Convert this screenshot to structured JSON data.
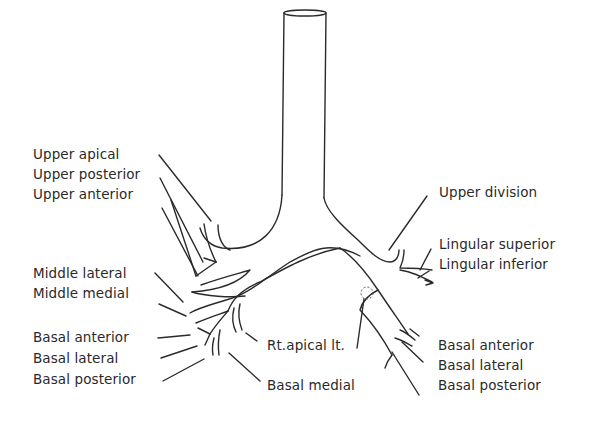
{
  "diagram": {
    "type": "bronchial tree",
    "labels": {
      "left_side": {
        "upper_apical": "Upper apical",
        "upper_posterior": "Upper posterior",
        "upper_anterior": "Upper anterior",
        "middle_lateral": "Middle lateral",
        "middle_medial": "Middle medial",
        "basal_anterior": "Basal anterior",
        "basal_lateral": "Basal lateral",
        "basal_posterior": "Basal posterior"
      },
      "center": {
        "rt_apical_lt": "Rt.apical lt.",
        "basal_medial": "Basal medial"
      },
      "right_side": {
        "upper_division": "Upper division",
        "lingular_superior": "Lingular superior",
        "lingular_inferior": "Lingular inferior",
        "basal_anterior": "Basal anterior",
        "basal_lateral": "Basal lateral",
        "basal_posterior": "Basal posterior"
      }
    }
  }
}
